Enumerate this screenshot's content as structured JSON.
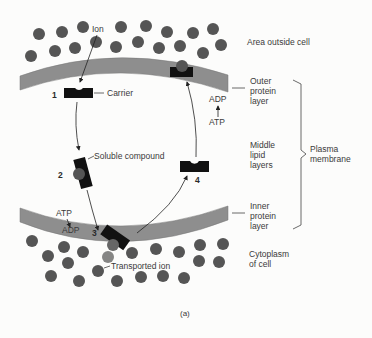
{
  "figure": {
    "caption": "(a)",
    "colors": {
      "background": "#fcfcfb",
      "membrane": "#8e8e8e",
      "membrane_edge": "#6a6a6a",
      "ion": "#555555",
      "carrier": "#0e0e0e",
      "text": "#3a3a3a"
    },
    "regions": {
      "outside": "Area outside cell",
      "cytoplasm_line1": "Cytoplasm",
      "cytoplasm_line2": "of cell"
    },
    "layers": {
      "outer": [
        "Outer",
        "protein",
        "layer"
      ],
      "middle": [
        "Middle",
        "lipid",
        "layers"
      ],
      "inner": [
        "Inner",
        "protein",
        "layer"
      ]
    },
    "brace_label": [
      "Plasma",
      "membrane"
    ],
    "labels": {
      "ion": "Ion",
      "carrier": "Carrier",
      "soluble_compound": "Soluble compound",
      "transported_ion": "Transported ion",
      "atp_top": "ATP",
      "adp_top": "ADP",
      "atp_bottom": "ATP",
      "adp_bottom": "ADP"
    },
    "steps": [
      "1",
      "2",
      "3",
      "4"
    ]
  }
}
